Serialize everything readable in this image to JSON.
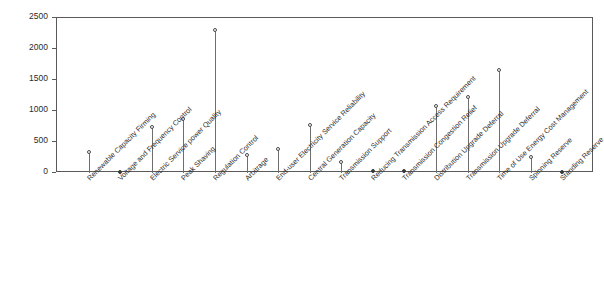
{
  "chart_data": {
    "type": "bar",
    "plot_style": "stem",
    "title": "",
    "subtitle": "",
    "xlabel": "",
    "ylabel": "Value ($/kW)",
    "ylim": [
      0,
      2500
    ],
    "ytick_labels": [
      "0",
      "500",
      "1000",
      "1500",
      "2000",
      "2500"
    ],
    "ytick_values": [
      0,
      500,
      1000,
      1500,
      2000,
      2500
    ],
    "grid": false,
    "legend": null,
    "categories": [
      "Renewable Capacity Firming",
      "Voltage and Frequency Control",
      "Electric Service power Quality",
      "Peak Shaving",
      "Regulation Control",
      "Arbitrage",
      "End-user Electricity Service Reliability",
      "Central Generation Capacity",
      "Transmission Support",
      "Reducing Transmission Access Requirement",
      "Transmission Congestion Relief",
      "Distribution Upgrade Deferral",
      "Transmission Upgrade Deferral",
      "Time of Use Energy Cost Management",
      "Spinning Reserve",
      "Standing Reserve"
    ],
    "values": [
      330,
      10,
      740,
      855,
      2300,
      285,
      375,
      770,
      165,
      30,
      20,
      1070,
      1210,
      1650,
      255,
      15
    ]
  }
}
